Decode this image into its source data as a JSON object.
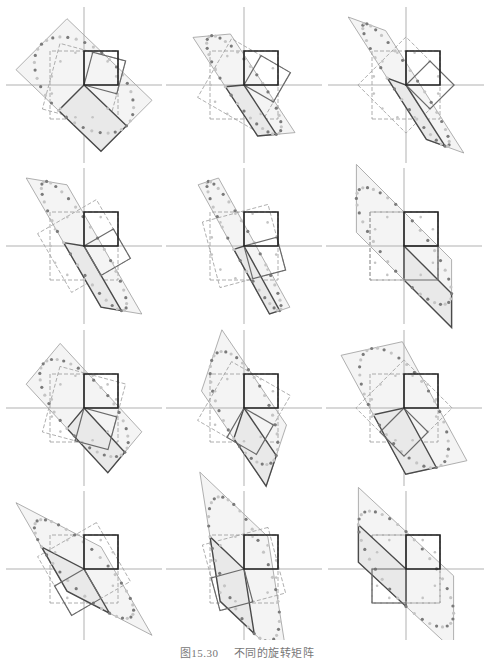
{
  "figure": {
    "caption_number": "图15.30",
    "caption_text": "不同的旋转矩阵",
    "unit_px": 34,
    "colors": {
      "axis": "#a8a8a8",
      "unit_square": "#222222",
      "rotated_square": "#6a6a6a",
      "dashed_square": "#9a9a9a",
      "outer_parallelogram": "#9c9c9c",
      "mapped_parallelogram": "#4a4a4a",
      "fill": "#e9e9e9",
      "dots_dark": "#7a7a7a",
      "dots_light": "#c4c4c4"
    }
  },
  "panels": [
    {
      "id": 1,
      "cx": 84,
      "cy": 85,
      "theta": -15,
      "A": [
        [
          1.25,
          -0.75
        ],
        [
          -1.2,
          -0.75
        ]
      ]
    },
    {
      "id": 2,
      "cx": 244,
      "cy": 85,
      "theta": -30,
      "A": [
        [
          0.95,
          -0.55
        ],
        [
          -1.45,
          -0.05
        ]
      ]
    },
    {
      "id": 3,
      "cx": 406,
      "cy": 85,
      "theta": -45,
      "A": [
        [
          1.15,
          -0.55
        ],
        [
          -1.8,
          0.2
        ]
      ]
    },
    {
      "id": 4,
      "cx": 84,
      "cy": 246,
      "theta": -60,
      "A": [
        [
          1.1,
          -0.6
        ],
        [
          -1.9,
          0.1
        ]
      ]
    },
    {
      "id": 5,
      "cx": 244,
      "cy": 246,
      "theta": -75,
      "A": [
        [
          1.05,
          -0.3
        ],
        [
          -1.9,
          -0.1
        ]
      ]
    },
    {
      "id": 6,
      "cx": 404,
      "cy": 246,
      "theta": -90,
      "A": [
        [
          1.4,
          0.0
        ],
        [
          -1.4,
          -1.0
        ]
      ]
    },
    {
      "id": 7,
      "cx": 84,
      "cy": 408,
      "theta": -105,
      "A": [
        [
          1.2,
          -0.5
        ],
        [
          -1.3,
          -0.6
        ]
      ]
    },
    {
      "id": 8,
      "cx": 244,
      "cy": 408,
      "theta": -120,
      "A": [
        [
          0.95,
          -0.3
        ],
        [
          -1.4,
          -0.9
        ]
      ]
    },
    {
      "id": 9,
      "cx": 404,
      "cy": 408,
      "theta": -135,
      "A": [
        [
          0.95,
          -0.9
        ],
        [
          -1.75,
          -0.2
        ]
      ]
    },
    {
      "id": 10,
      "cx": 84,
      "cy": 569,
      "theta": -150,
      "A": [
        [
          0.75,
          -1.25
        ],
        [
          -1.3,
          0.65
        ]
      ]
    },
    {
      "id": 11,
      "cx": 244,
      "cy": 569,
      "theta": -165,
      "A": [
        [
          0.3,
          -1.0
        ],
        [
          -1.9,
          0.95
        ]
      ]
    },
    {
      "id": 12,
      "cx": 406,
      "cy": 569,
      "theta": -180,
      "A": [
        [
          0.0,
          -1.4
        ],
        [
          -1.1,
          1.3
        ]
      ]
    }
  ]
}
